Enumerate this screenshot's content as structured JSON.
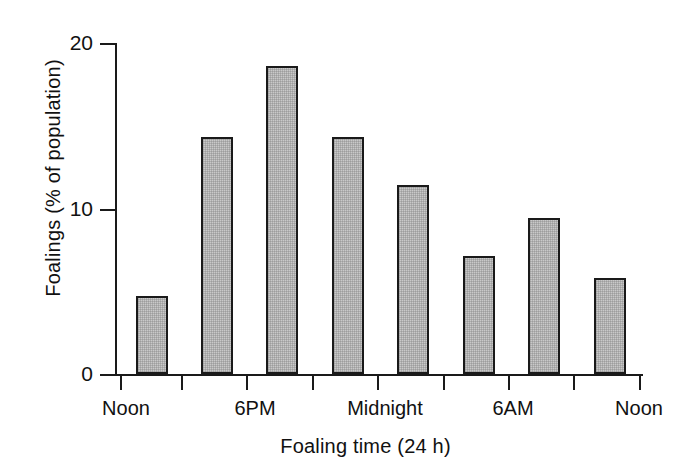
{
  "chart_data": {
    "type": "bar",
    "title": "",
    "xlabel": "Foaling time (24 h)",
    "ylabel": "Foalings (% of population)",
    "categories": [
      "12:00-15:00",
      "15:00-18:00",
      "18:00-21:00",
      "21:00-00:00",
      "00:00-03:00",
      "03:00-06:00",
      "06:00-09:00",
      "09:00-12:00"
    ],
    "values": [
      4.7,
      14.3,
      18.6,
      14.3,
      11.4,
      7.1,
      9.4,
      5.8
    ],
    "ylim": [
      0,
      20
    ],
    "yticks": [
      0,
      10,
      20
    ],
    "ytick_labels": [
      "0",
      "10",
      "20"
    ],
    "xtick_labels": [
      "Noon",
      "6PM",
      "Midnight",
      "6AM",
      "Noon"
    ],
    "grid": false,
    "legend": null,
    "bar_fill": "#c9c9c9",
    "bar_edge": "#1a1a1a",
    "axis_color": "#1a1a1a",
    "background": "#ffffff"
  },
  "axis": {
    "y_label": "Foalings (% of population)",
    "x_label": "Foaling time (24 h)",
    "y_tick_0": "0",
    "y_tick_1": "10",
    "y_tick_2": "20",
    "x_cat_0": "Noon",
    "x_cat_1": "6PM",
    "x_cat_2": "Midnight",
    "x_cat_3": "6AM",
    "x_cat_4": "Noon"
  }
}
